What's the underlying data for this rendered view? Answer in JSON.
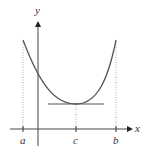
{
  "diagram": {
    "type": "function-graph",
    "axes": {
      "x_label": "x",
      "y_label": "y"
    },
    "points": {
      "a": "a",
      "c": "c",
      "b": "b"
    },
    "curve": "parabola with minimum at c",
    "tangent": "horizontal tangent line at vertex (x = c)",
    "colors": {
      "curve": "#555555",
      "axis": "#444444",
      "guide": "#999999"
    }
  }
}
